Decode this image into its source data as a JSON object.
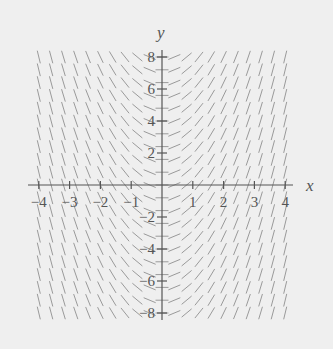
{
  "chart_data": {
    "type": "slope_field",
    "title": "",
    "xlabel": "x",
    "ylabel": "y",
    "xlim": [
      -4,
      4
    ],
    "ylim": [
      -8,
      8
    ],
    "x_ticks": [
      -4,
      -3,
      -2,
      -1,
      1,
      2,
      3,
      4
    ],
    "x_tick_labels": [
      "−4",
      "−3",
      "−2",
      "−1",
      "1",
      "2",
      "3",
      "4"
    ],
    "y_ticks": [
      8,
      6,
      4,
      2,
      -2,
      -4,
      -6,
      -8
    ],
    "y_tick_labels": [
      "8",
      "6",
      "4",
      "2",
      "−2",
      "−4",
      "−6",
      "−8"
    ],
    "grid": false,
    "legend": null,
    "slope_function": "dy/dx ≈ 2x (slope depends only on x; negative for x<0, positive for x>0)",
    "field_grid": {
      "x_start": -4,
      "x_end": 4,
      "x_step": 0.4,
      "y_start": -8,
      "y_end": 8,
      "y_step": 0.8
    },
    "colors": {
      "background": "#efefef",
      "segments": "#9a9a9a",
      "axes": "#555555"
    }
  }
}
